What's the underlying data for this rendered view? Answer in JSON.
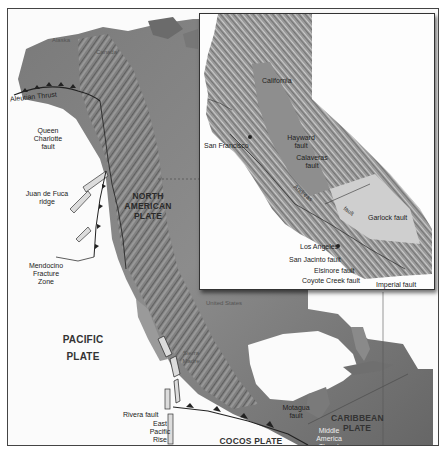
{
  "map": {
    "main_labels": {
      "alaska": "Alaska",
      "canada": "Canada",
      "aleutian_thrust": "Aleutian Thrust",
      "queen_charlotte": [
        "Queen",
        "Charlotte",
        "fault"
      ],
      "juan_de_fuca": [
        "Juan de Fuca",
        "ridge"
      ],
      "mendocino": [
        "Mendocino",
        "Fracture",
        "Zone"
      ],
      "north_american_plate": [
        "NORTH",
        "AMERICAN",
        "PLATE"
      ],
      "pacific_plate": [
        "PACIFIC",
        "PLATE"
      ],
      "united_states": "United States",
      "sierra_madre": [
        "Sierra",
        "Madre"
      ],
      "rivera_fault": "Rivera fault",
      "east_pacific_rise": [
        "East",
        "Pacific",
        "Rise"
      ],
      "cocos_plate": "COCOS PLATE",
      "motagua_fault": [
        "Motagua",
        "fault"
      ],
      "caribbean_plate": [
        "CARIBBEAN",
        "PLATE"
      ],
      "middle_america_thrust": [
        "Middle",
        "America",
        "Thrust"
      ]
    },
    "inset": {
      "california": "California",
      "san_francisco": "San Francisco",
      "hayward_fault": [
        "Hayward",
        "fault"
      ],
      "calaveras_fault": [
        "Calaveras",
        "fault"
      ],
      "san_andreas": [
        "San",
        "Andreas",
        "fault"
      ],
      "garlock_fault": "Garlock fault",
      "los_angeles": "Los Angeles",
      "san_jacinto_fault": "San Jacinto fault",
      "elsinore_fault": "Elsinore fault",
      "coyote_creek_fault": "Coyote Creek fault",
      "imperial_fault": "Imperial fault"
    },
    "colors": {
      "ocean": "#fbfbfb",
      "land_dark": "#6e6e6e",
      "land_mid": "#9a9a9a",
      "land_light": "#c8c8c8",
      "frame": "#444444"
    }
  }
}
